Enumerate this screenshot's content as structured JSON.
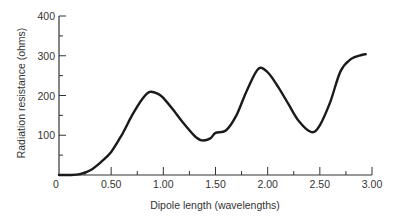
{
  "chart_data": {
    "type": "line",
    "title": "",
    "xlabel": "Dipole length (wavelengths)",
    "ylabel": "Radiation resistance (ohms)",
    "xlim": [
      0,
      3.0
    ],
    "ylim": [
      0,
      400
    ],
    "grid": false,
    "legend": null,
    "x_ticks": [
      0,
      0.5,
      1.0,
      1.5,
      2.0,
      2.5,
      3.0
    ],
    "x_tick_labels": [
      "0",
      "0.50",
      "1.00",
      "1.50",
      "2.00",
      "2.50",
      "3.00"
    ],
    "x_minor_ticks": [
      0.25,
      0.75,
      1.25,
      1.75,
      2.25,
      2.75
    ],
    "y_ticks": [
      100,
      200,
      300,
      400
    ],
    "y_tick_labels": [
      "100",
      "200",
      "300",
      "400"
    ],
    "y_minor_ticks": [
      50,
      150,
      250,
      350
    ],
    "series": [
      {
        "name": "Radiation resistance",
        "color": "#1a1a1a",
        "x": [
          0,
          0.1,
          0.2,
          0.3,
          0.4,
          0.5,
          0.6,
          0.7,
          0.8,
          0.87,
          0.95,
          1.0,
          1.1,
          1.2,
          1.3,
          1.37,
          1.45,
          1.5,
          1.6,
          1.7,
          1.8,
          1.91,
          2.0,
          2.1,
          2.2,
          2.3,
          2.42,
          2.5,
          2.6,
          2.7,
          2.8,
          2.9,
          2.94
        ],
        "values": [
          0,
          0,
          2,
          12,
          32,
          58,
          100,
          150,
          192,
          209,
          204,
          194,
          162,
          128,
          98,
          87,
          92,
          106,
          112,
          150,
          212,
          267,
          258,
          222,
          178,
          135,
          108,
          125,
          184,
          262,
          292,
          302,
          304
        ]
      }
    ]
  }
}
